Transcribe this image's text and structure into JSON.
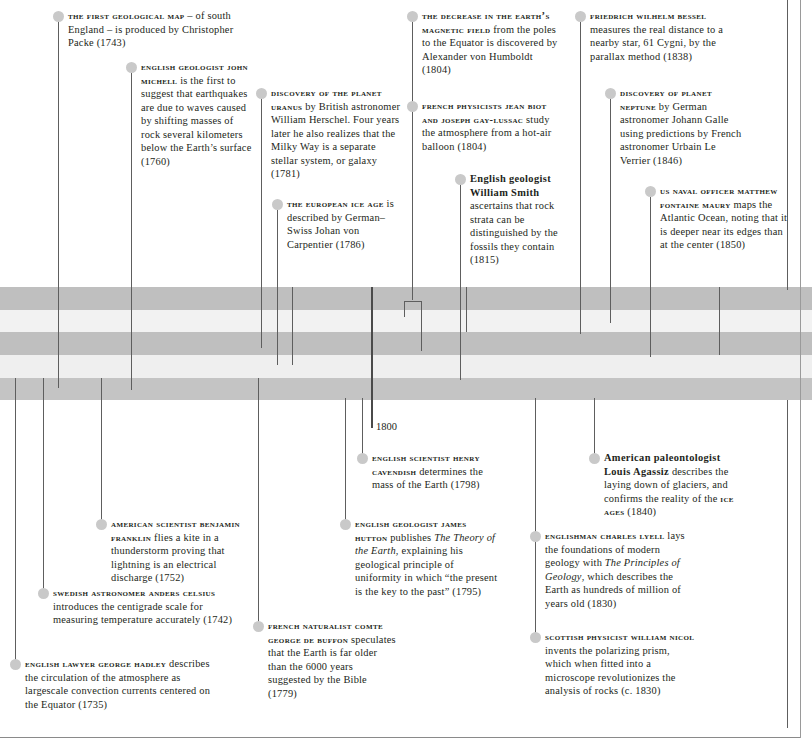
{
  "page": {
    "width": 812,
    "height": 748,
    "background": "#ffffff",
    "rule_color": "#8a8a8a"
  },
  "timeline": {
    "axis_label": "1800",
    "band_colors": {
      "dark": "#c0c0c0",
      "light": "#efefef",
      "mid": "#d9d9d9"
    },
    "bands": [
      {
        "name": "band-dark-1",
        "top": 287,
        "height": 23,
        "color": "#bfbfbf"
      },
      {
        "name": "band-light-1",
        "top": 310,
        "height": 22,
        "color": "#f2f2f2"
      },
      {
        "name": "band-dark-2",
        "top": 332,
        "height": 23,
        "color": "#bfbfbf"
      },
      {
        "name": "band-light-2",
        "top": 355,
        "height": 23,
        "color": "#efefef"
      },
      {
        "name": "band-dark-3",
        "top": 378,
        "height": 22,
        "color": "#c4c4c4"
      }
    ],
    "dot_color": "#c9c9c9",
    "connector_color": "#5e5e5e"
  },
  "entries_above": [
    {
      "id": "first-geological-map",
      "title": "The first geological map",
      "body": " – of south England – is produced by Christopher Packe (1743)",
      "year": "1743",
      "dot_x": 53,
      "dot_y": 11,
      "text_x": 68,
      "text_y": 9,
      "text_w": 170,
      "line_x": 58,
      "line_y": 22,
      "line_h": 366
    },
    {
      "id": "john-michell",
      "title": "English geologist John Michell",
      "body": " is the first to suggest that earthquakes are due to waves caused by shifting masses of rock several kilometers below the Earth’s surface (1760)",
      "year": "1760",
      "dot_x": 126,
      "dot_y": 62,
      "text_x": 141,
      "text_y": 60,
      "text_w": 112,
      "line_x": 131,
      "line_y": 73,
      "line_h": 317
    },
    {
      "id": "uranus",
      "title": "Discovery of the planet Uranus",
      "body": " by British astronomer William Herschel. Four years later he also realizes that the Milky Way is a separate stellar system, or galaxy (1781)",
      "year": "1781",
      "dot_x": 256,
      "dot_y": 88,
      "text_x": 271,
      "text_y": 86,
      "text_w": 134,
      "line_x": 261,
      "line_y": 99,
      "line_h": 249
    },
    {
      "id": "european-ice-age",
      "title": "The European ice age",
      "body": " is described by German–Swiss Johan von Carpentier (1786)",
      "year": "1786",
      "dot_x": 272,
      "dot_y": 199,
      "text_x": 287,
      "text_y": 197,
      "text_w": 112,
      "line_x": 277,
      "line_y": 210,
      "line_h": 155
    },
    {
      "id": "earth-magnetic-field",
      "title": "The decrease in the Earth’s magnetic field",
      "body": " from the poles to the Equator is discovered by Alexander von Humboldt (1804)",
      "year": "1804",
      "dot_x": 407,
      "dot_y": 11,
      "text_x": 422,
      "text_y": 9,
      "text_w": 138,
      "line_x": 412,
      "line_y": 22,
      "line_h": 278
    },
    {
      "id": "biot-gay-lussac",
      "title": "French physicists Jean Biot and Joseph Gay-Lussac",
      "body": " study the atmosphere from a hot-air balloon (1804)",
      "year": "1804",
      "dot_x": 407,
      "dot_y": 101,
      "text_x": 422,
      "text_y": 99,
      "text_w": 142,
      "line_x": 412,
      "line_y": 112,
      "line_h": 188
    },
    {
      "id": "william-smith",
      "title": "English geologist William Smith",
      "body": " ascertains that rock strata can be distinguished by the fossils they contain (1815)",
      "year": "1815",
      "dot_x": 455,
      "dot_y": 174,
      "text_x": 470,
      "text_y": 172,
      "text_w": 108,
      "line_x": 460,
      "line_y": 185,
      "line_h": 195,
      "title_plain": true
    },
    {
      "id": "bessel",
      "title": "Friedrich Wilhelm Bessel",
      "body": " measures the real distance to a nearby star, 61 Cygni, by the parallax method (1838)",
      "year": "1838",
      "dot_x": 575,
      "dot_y": 11,
      "text_x": 590,
      "text_y": 9,
      "text_w": 136,
      "line_x": 580,
      "line_y": 22,
      "line_h": 312
    },
    {
      "id": "neptune",
      "title": "Discovery of planet Neptune",
      "body": " by German astronomer Johann Galle using predictions by French astronomer Urbain Le Verrier (1846)",
      "year": "1846",
      "dot_x": 605,
      "dot_y": 88,
      "text_x": 620,
      "text_y": 86,
      "text_w": 124,
      "line_x": 610,
      "line_y": 99,
      "line_h": 224
    },
    {
      "id": "maury",
      "title": "US naval officer Matthew Fontaine Maury",
      "body": " maps the Atlantic Ocean, noting that it is deeper near its edges than at the center (1850)",
      "year": "1850",
      "dot_x": 645,
      "dot_y": 186,
      "text_x": 660,
      "text_y": 184,
      "text_w": 128,
      "line_x": 650,
      "line_y": 197,
      "line_h": 160
    }
  ],
  "entries_below": [
    {
      "id": "henry-cavendish",
      "title": "English scientist Henry Cavendish",
      "body": " determines the mass of the Earth (1798)",
      "year": "1798",
      "dot_x": 357,
      "dot_y": 453,
      "text_x": 372,
      "text_y": 451,
      "text_w": 126,
      "line_x": 362,
      "line_y": 398,
      "line_h": 58
    },
    {
      "id": "james-hutton",
      "title": "English geologist James Hutton",
      "body": " publishes ",
      "italic": "The Theory of the Earth",
      "body2": ", explaining his geological principle of uniformity in which “the present is the key to the past” (1795)",
      "year": "1795",
      "dot_x": 340,
      "dot_y": 519,
      "text_x": 355,
      "text_y": 517,
      "text_w": 146,
      "line_x": 345,
      "line_y": 398,
      "line_h": 124
    },
    {
      "id": "benjamin-franklin",
      "title": "American scientist Benjamin Franklin",
      "body": " flies a kite in a thunderstorm proving that lightning is an electrical discharge (1752)",
      "year": "1752",
      "dot_x": 96,
      "dot_y": 519,
      "text_x": 111,
      "text_y": 517,
      "text_w": 142,
      "line_x": 101,
      "line_y": 378,
      "line_h": 144
    },
    {
      "id": "anders-celsius",
      "title": "Swedish astronomer Anders Celsius",
      "body": " introduces the centigrade scale for measuring temperature accurately (1742)",
      "year": "1742",
      "dot_x": 38,
      "dot_y": 588,
      "text_x": 53,
      "text_y": 586,
      "text_w": 182,
      "line_x": 43,
      "line_y": 378,
      "line_h": 213
    },
    {
      "id": "george-hadley",
      "title": "English lawyer George Hadley",
      "body": " describes the circulation of the atmosphere as largescale convection currents centered on the Equator (1735)",
      "year": "1735",
      "dot_x": 10,
      "dot_y": 659,
      "text_x": 25,
      "text_y": 657,
      "text_w": 192,
      "line_x": 15,
      "line_y": 378,
      "line_h": 284
    },
    {
      "id": "comte-de-buffon",
      "title": "French naturalist Comte George de Buffon",
      "body": " speculates that the Earth is far older than the 6000 years suggested by the Bible (1779)",
      "year": "1779",
      "dot_x": 253,
      "dot_y": 621,
      "text_x": 268,
      "text_y": 619,
      "text_w": 130,
      "line_x": 258,
      "line_y": 378,
      "line_h": 246
    },
    {
      "id": "louis-agassiz",
      "title": "American paleontologist Louis Agassiz",
      "body": " describes the laying down of glaciers, and confirms the reality of the ",
      "tail_caps": "ice ages",
      "body2": " (1840)",
      "year": "1840",
      "dot_x": 589,
      "dot_y": 453,
      "text_x": 604,
      "text_y": 451,
      "text_w": 136,
      "line_x": 594,
      "line_y": 398,
      "line_h": 58,
      "title_plain": true
    },
    {
      "id": "charles-lyell",
      "title": "Englishman Charles Lyell",
      "body": " lays the foundations of modern geology with ",
      "italic": "The Principles of Geology",
      "body2": ", which describes the Earth as hundreds of million of years old (1830)",
      "year": "1830",
      "dot_x": 530,
      "dot_y": 531,
      "text_x": 545,
      "text_y": 529,
      "text_w": 146,
      "line_x": 535,
      "line_y": 398,
      "line_h": 136
    },
    {
      "id": "william-nicol",
      "title": "Scottish physicist William Nicol",
      "body": " invents the polarizing prism, which when fitted into a microscope revolutionizes the analysis of rocks (c. 1830)",
      "year": "1830",
      "dot_x": 530,
      "dot_y": 632,
      "text_x": 545,
      "text_y": 630,
      "text_w": 150,
      "line_x": 535,
      "line_y": 398,
      "line_h": 237
    }
  ],
  "extra_connectors": [
    {
      "name": "axis-1800-marker",
      "x": 371,
      "top": 287,
      "height": 141,
      "thick": true
    },
    {
      "name": "connector-midA",
      "x": 404,
      "top": 301,
      "height": 16
    },
    {
      "name": "connector-midA-horizontal",
      "x": 404,
      "y": 301,
      "width": 18
    },
    {
      "name": "connector-midB",
      "x": 421,
      "top": 301,
      "height": 50
    },
    {
      "name": "connector-short-1",
      "x": 292,
      "top": 287,
      "height": 78
    },
    {
      "name": "connector-short-2",
      "x": 466,
      "top": 287,
      "height": 45
    },
    {
      "name": "connector-short-3",
      "x": 719,
      "top": 287,
      "height": 68
    },
    {
      "name": "connector-short-4",
      "x": 787,
      "top": 0,
      "height": 290
    },
    {
      "name": "connector-short-5",
      "x": 787,
      "top": 400,
      "height": 328
    }
  ]
}
